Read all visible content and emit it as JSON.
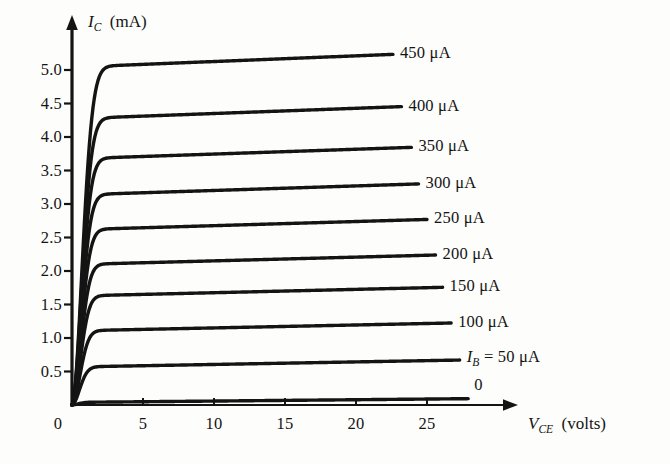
{
  "figure": {
    "background": "#fdfdfb",
    "ink": "#141414"
  },
  "axes": {
    "y_axis_title_symbol": "I",
    "y_axis_title_sub": "C",
    "y_axis_title_unit": "(mA)",
    "x_axis_title_symbol": "V",
    "x_axis_title_sub": "CE",
    "x_axis_title_unit": "(volts)",
    "y_ticks": [
      "5.0",
      "4.5",
      "4.0",
      "3.5",
      "3.0",
      "2.5",
      "2.0",
      "1.5",
      "1.0",
      "0.5"
    ],
    "x_ticks": [
      "5",
      "10",
      "15",
      "20",
      "25"
    ],
    "origin_label": "0"
  },
  "curve_labels": [
    "450 μA",
    "400 μA",
    "350 μA",
    "300 μA",
    "250 μA",
    "200 μA",
    "150 μA",
    "100 μA",
    "",
    "0"
  ],
  "ib_label": {
    "symbol": "I",
    "sub": "B",
    "rest": "= 50 μA"
  },
  "chart_data": {
    "type": "line",
    "title": "",
    "xlabel": "V_CE (volts)",
    "ylabel": "I_C (mA)",
    "xlim": [
      0,
      28
    ],
    "ylim": [
      0,
      5.6
    ],
    "grid": false,
    "legend_position": "right-inline-annotations",
    "x_ticks": [
      5,
      10,
      15,
      20,
      25
    ],
    "y_ticks": [
      0.5,
      1.0,
      1.5,
      2.0,
      2.5,
      3.0,
      3.5,
      4.0,
      4.5,
      5.0
    ],
    "series": [
      {
        "name": "450 μA",
        "base_ic": 5.05,
        "knee_v": 1.0,
        "end_v": 22.6,
        "slope": 0.0085,
        "label": "450 μA"
      },
      {
        "name": "400 μA",
        "base_ic": 4.28,
        "knee_v": 0.95,
        "end_v": 23.2,
        "slope": 0.0078,
        "label": "400 μA"
      },
      {
        "name": "350 μA",
        "base_ic": 3.68,
        "knee_v": 0.92,
        "end_v": 23.9,
        "slope": 0.0072,
        "label": "350 μA"
      },
      {
        "name": "300 μA",
        "base_ic": 3.14,
        "knee_v": 0.9,
        "end_v": 24.4,
        "slope": 0.0068,
        "label": "300 μA"
      },
      {
        "name": "250 μA",
        "base_ic": 2.62,
        "knee_v": 0.88,
        "end_v": 25.0,
        "slope": 0.0062,
        "label": "250 μA"
      },
      {
        "name": "200 μA",
        "base_ic": 2.1,
        "knee_v": 0.85,
        "end_v": 25.6,
        "slope": 0.0056,
        "label": "200 μA"
      },
      {
        "name": "150 μA",
        "base_ic": 1.63,
        "knee_v": 0.82,
        "end_v": 26.1,
        "slope": 0.005,
        "label": "150 μA"
      },
      {
        "name": "100 μA",
        "base_ic": 1.11,
        "knee_v": 0.8,
        "end_v": 26.7,
        "slope": 0.0044,
        "label": "100 μA"
      },
      {
        "name": "50 μA",
        "base_ic": 0.57,
        "knee_v": 0.75,
        "end_v": 27.3,
        "slope": 0.0038,
        "label": "I_B = 50 μA"
      },
      {
        "name": "0",
        "base_ic": 0.04,
        "knee_v": 0.6,
        "end_v": 27.9,
        "slope": 0.002,
        "label": "0"
      }
    ],
    "note": "Common-emitter collector characteristic curves of a BJT: I_C vs V_CE for stepped base currents I_B from 0 to 450 microamps in 50 microamp steps."
  },
  "geometry": {
    "x0": 72,
    "y0": 405,
    "px_per_volt": 14.2,
    "px_per_ma": 67.0
  }
}
